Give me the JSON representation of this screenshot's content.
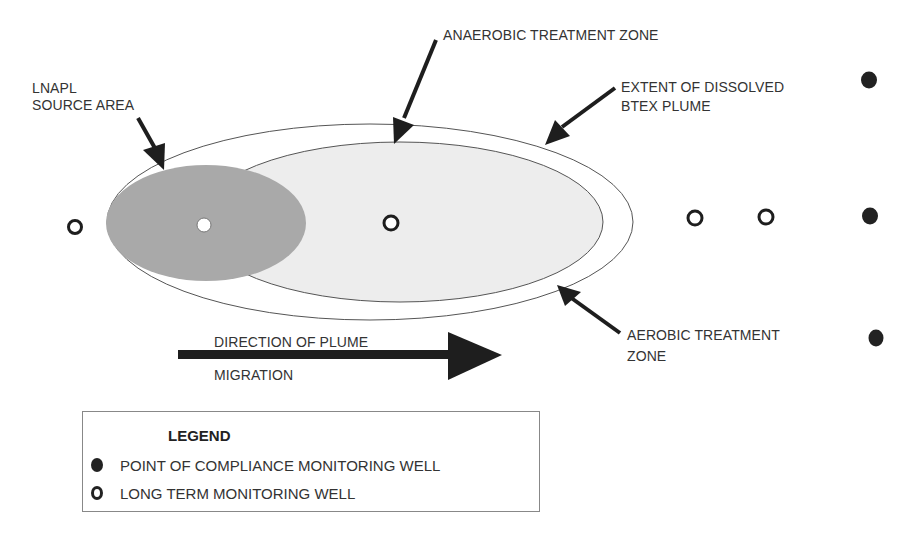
{
  "labels": {
    "lnapl_source": [
      "LNAPL",
      "SOURCE AREA"
    ],
    "anaerobic_zone": "ANAEROBIC TREATMENT ZONE",
    "extent_plume": [
      "EXTENT OF DISSOLVED",
      "BTEX PLUME"
    ],
    "aerobic_zone": [
      "AEROBIC TREATMENT",
      "ZONE"
    ],
    "direction": [
      "DIRECTION OF PLUME",
      "MIGRATION"
    ]
  },
  "legend": {
    "title": "LEGEND",
    "items": [
      {
        "symbol": "filled-circle",
        "label": "POINT OF COMPLIANCE MONITORING WELL"
      },
      {
        "symbol": "hollow-circle",
        "label": "LONG TERM MONITORING WELL"
      }
    ]
  },
  "wells": {
    "long_term": [
      {
        "x": 75,
        "y": 227
      },
      {
        "x": 204,
        "y": 225,
        "inside_source": true
      },
      {
        "x": 391,
        "y": 223
      },
      {
        "x": 695,
        "y": 218
      },
      {
        "x": 766,
        "y": 217
      }
    ],
    "point_of_compliance": [
      {
        "x": 869,
        "y": 80
      },
      {
        "x": 870,
        "y": 216
      },
      {
        "x": 876,
        "y": 338
      }
    ]
  },
  "colors": {
    "source_area": "#a9a9a9",
    "anaerobic_fill": "#ececec",
    "plume_outline": "#555555",
    "ink": "#1e1e1e"
  }
}
